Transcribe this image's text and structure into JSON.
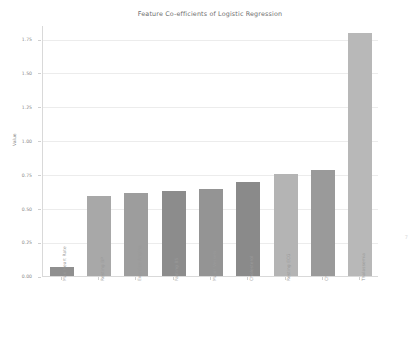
{
  "figure": {
    "background_color": "#ffffff",
    "corner_mark": "7"
  },
  "chart_data": {
    "type": "bar",
    "title": "Feature Co-efficients of Logistic Regression",
    "xlabel": "",
    "ylabel": "Value",
    "ylim": [
      0.0,
      1.85
    ],
    "grid": true,
    "legend": "none",
    "categories": [
      "Max Heart Rate",
      "Resting BP",
      "Exercise Angina",
      "Fasting BS",
      "Major Vessels",
      "Cholesterol",
      "Resting ECG",
      "Chest Pain Type",
      "Thalassemia"
    ],
    "values": [
      0.07,
      0.59,
      0.61,
      0.63,
      0.64,
      0.69,
      0.75,
      0.78,
      1.79
    ],
    "bar_colors": [
      "#8f8f8f",
      "#a8a8a8",
      "#9d9d9d",
      "#8c8c8c",
      "#949494",
      "#8a8a8a",
      "#b4b4b4",
      "#9a9a9a",
      "#b8b8b8"
    ],
    "yticks": [
      0.0,
      0.25,
      0.5,
      0.75,
      1.0,
      1.25,
      1.5,
      1.75
    ],
    "ytick_labels": [
      "0.00",
      "0.25",
      "0.50",
      "0.75",
      "1.00",
      "1.25",
      "1.50",
      "1.75"
    ]
  }
}
